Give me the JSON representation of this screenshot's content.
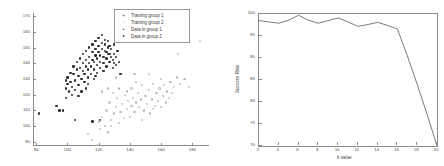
{
  "chart_data": [
    {
      "type": "scatter",
      "title": "",
      "xlabel": "",
      "ylabel": "",
      "xlim": [
        78,
        190
      ],
      "ylim": [
        88,
        172
      ],
      "xticks": [
        80,
        100,
        120,
        140,
        160,
        180
      ],
      "yticks": [
        90,
        100,
        110,
        120,
        130,
        140,
        150,
        160,
        170
      ],
      "grid": false,
      "legend_position": "top-right",
      "legend": [
        {
          "label": "Training group 1",
          "marker": "plus",
          "color": "#2e2e2e"
        },
        {
          "label": "Training group 2",
          "marker": "dot",
          "color": "#b4b4b4"
        },
        {
          "label": "Data in group 1",
          "marker": "filled-circle",
          "color": "#2e2e2e"
        },
        {
          "label": "Data in group 2",
          "marker": "open-circle",
          "color": "#b4b4b4"
        }
      ],
      "series": [
        {
          "name": "Data in group 1",
          "color": "#2e2e2e",
          "points": [
            [
              82,
              108
            ],
            [
              93,
              113
            ],
            [
              95,
              110
            ],
            [
              97,
              110
            ],
            [
              99,
              118
            ],
            [
              99,
              124
            ],
            [
              100,
              127
            ],
            [
              100,
              131
            ],
            [
              101,
              122
            ],
            [
              102,
              128
            ],
            [
              102,
              134
            ],
            [
              103,
              120
            ],
            [
              103,
              125
            ],
            [
              104,
              133
            ],
            [
              104,
              138
            ],
            [
              105,
              123
            ],
            [
              105,
              129
            ],
            [
              106,
              136
            ],
            [
              106,
              141
            ],
            [
              107,
              126
            ],
            [
              107,
              132
            ],
            [
              108,
              137
            ],
            [
              108,
              143
            ],
            [
              109,
              122
            ],
            [
              109,
              130
            ],
            [
              110,
              135
            ],
            [
              110,
              140
            ],
            [
              110,
              146
            ],
            [
              111,
              128
            ],
            [
              111,
              133
            ],
            [
              112,
              138
            ],
            [
              112,
              142
            ],
            [
              112,
              148
            ],
            [
              113,
              131
            ],
            [
              113,
              136
            ],
            [
              114,
              140
            ],
            [
              114,
              144
            ],
            [
              114,
              150
            ],
            [
              115,
              133
            ],
            [
              115,
              138
            ],
            [
              116,
              142
            ],
            [
              116,
              147
            ],
            [
              116,
              152
            ],
            [
              117,
              130
            ],
            [
              117,
              136
            ],
            [
              117,
              141
            ],
            [
              118,
              145
            ],
            [
              118,
              149
            ],
            [
              118,
              154
            ],
            [
              119,
              134
            ],
            [
              119,
              139
            ],
            [
              119,
              143
            ],
            [
              120,
              147
            ],
            [
              120,
              151
            ],
            [
              120,
              156
            ],
            [
              121,
              137
            ],
            [
              121,
              141
            ],
            [
              121,
              145
            ],
            [
              122,
              149
            ],
            [
              122,
              153
            ],
            [
              122,
              158
            ],
            [
              123,
              135
            ],
            [
              123,
              140
            ],
            [
              123,
              144
            ],
            [
              124,
              148
            ],
            [
              124,
              152
            ],
            [
              124,
              155
            ],
            [
              125,
              138
            ],
            [
              125,
              143
            ],
            [
              125,
              147
            ],
            [
              126,
              150
            ],
            [
              126,
              154
            ],
            [
              127,
              141
            ],
            [
              127,
              146
            ],
            [
              127,
              151
            ],
            [
              128,
              144
            ],
            [
              128,
              149
            ],
            [
              129,
              137
            ],
            [
              129,
              142
            ],
            [
              130,
              146
            ],
            [
              130,
              152
            ],
            [
              131,
              139
            ],
            [
              131,
              144
            ],
            [
              132,
              148
            ],
            [
              133,
              141
            ],
            [
              134,
              133
            ],
            [
              134,
              157
            ],
            [
              105,
              104
            ],
            [
              116,
              103
            ],
            [
              121,
              104
            ],
            [
              99,
              129
            ],
            [
              107,
              119
            ],
            [
              113,
              127
            ],
            [
              126,
              146
            ],
            [
              130,
              140
            ],
            [
              112,
              124
            ],
            [
              118,
              132
            ]
          ]
        },
        {
          "name": "Data in group 2",
          "color": "#b4b4b4",
          "points": [
            [
              113,
              95
            ],
            [
              116,
              91
            ],
            [
              119,
              88
            ],
            [
              120,
              103
            ],
            [
              121,
              98
            ],
            [
              122,
              106
            ],
            [
              124,
              100
            ],
            [
              125,
              110
            ],
            [
              126,
              96
            ],
            [
              127,
              115
            ],
            [
              128,
              104
            ],
            [
              129,
              121
            ],
            [
              130,
              108
            ],
            [
              131,
              112
            ],
            [
              132,
              118
            ],
            [
              133,
              102
            ],
            [
              134,
              109
            ],
            [
              135,
              114
            ],
            [
              136,
              105
            ],
            [
              137,
              120
            ],
            [
              138,
              111
            ],
            [
              139,
              116
            ],
            [
              140,
              106
            ],
            [
              141,
              124
            ],
            [
              141,
              113
            ],
            [
              142,
              118
            ],
            [
              143,
              109
            ],
            [
              144,
              128
            ],
            [
              144,
              115
            ],
            [
              145,
              121
            ],
            [
              146,
              112
            ],
            [
              147,
              117
            ],
            [
              148,
              126
            ],
            [
              149,
              110
            ],
            [
              150,
              119
            ],
            [
              151,
              114
            ],
            [
              152,
              123
            ],
            [
              153,
              108
            ],
            [
              154,
              117
            ],
            [
              155,
              127
            ],
            [
              156,
              113
            ],
            [
              157,
              121
            ],
            [
              158,
              116
            ],
            [
              159,
              124
            ],
            [
              160,
              112
            ],
            [
              161,
              119
            ],
            [
              162,
              126
            ],
            [
              163,
              115
            ],
            [
              164,
              122
            ],
            [
              165,
              118
            ],
            [
              166,
              128
            ],
            [
              167,
              121
            ],
            [
              168,
              125
            ],
            [
              170,
              131
            ],
            [
              171,
              146
            ],
            [
              172,
              127
            ],
            [
              175,
              130
            ],
            [
              178,
              125
            ],
            [
              185,
              154
            ],
            [
              143,
              133
            ],
            [
              152,
              133
            ],
            [
              138,
              122
            ],
            [
              133,
              124
            ],
            [
              128,
              100
            ],
            [
              122,
              122
            ],
            [
              148,
              104
            ],
            [
              155,
              111
            ],
            [
              160,
              130
            ],
            [
              126,
              124
            ],
            [
              131,
              131
            ]
          ]
        }
      ]
    },
    {
      "type": "line",
      "title": "",
      "xlabel": "k value",
      "ylabel": "Success Rate",
      "xlim": [
        2,
        20
      ],
      "ylim": [
        70,
        100
      ],
      "xticks": [
        2,
        4,
        6,
        8,
        10,
        12,
        14,
        16,
        18,
        20
      ],
      "yticks": [
        70,
        75,
        80,
        85,
        90,
        95,
        100
      ],
      "grid": false,
      "legend_position": "none",
      "color": "#5a5a5a",
      "x": [
        2,
        3,
        4,
        5,
        6,
        7,
        8,
        9,
        10,
        11,
        12,
        13,
        14,
        15,
        16,
        17,
        18,
        19,
        20
      ],
      "values": [
        98.5,
        98.2,
        97.9,
        98.6,
        99.7,
        98.6,
        97.9,
        98.5,
        99.1,
        98.2,
        97.2,
        97.6,
        98.1,
        97.4,
        96.6,
        90.5,
        84.0,
        77.2,
        70.0
      ]
    }
  ],
  "panels": {
    "left": {
      "name": "scatter-panel"
    },
    "right": {
      "name": "line-panel"
    }
  }
}
